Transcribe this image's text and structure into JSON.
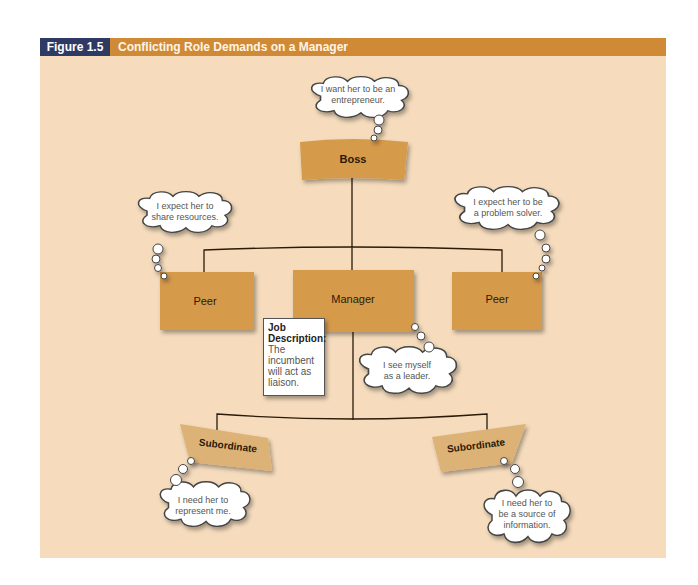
{
  "figure": {
    "number": "Figure 1.5",
    "title": "Conflicting Role Demands on a Manager",
    "colors": {
      "header_bar": "#d08a35",
      "number_box": "#2f3a64",
      "background": "#f6dcbd",
      "role_box": "#d69a4c",
      "subordinate_box": "#ddb276"
    }
  },
  "roles": {
    "boss": "Boss",
    "peer_left": "Peer",
    "manager": "Manager",
    "peer_right": "Peer",
    "subordinate_left": "Subordinate",
    "subordinate_right": "Subordinate"
  },
  "bubbles": {
    "boss": [
      "I want her to be an",
      "entrepreneur."
    ],
    "peer_left": [
      "I expect her to",
      "share resources."
    ],
    "peer_right": [
      "I expect her to be",
      "a problem solver."
    ],
    "manager": [
      "I see myself",
      "as a leader."
    ],
    "subordinate_left": [
      "I need her to",
      "represent me."
    ],
    "subordinate_right": [
      "I need her to",
      "be a source of",
      "information."
    ]
  },
  "job_description": {
    "title_line1": "Job",
    "title_line2": "Description:",
    "text_line1": "The",
    "text_line2": "incumbent",
    "text_line3": "will act as",
    "text_line4": "liaison."
  }
}
